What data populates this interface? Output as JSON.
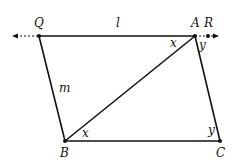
{
  "figure": {
    "type": "geometry-diagram",
    "points": {
      "Q": {
        "label": "Q"
      },
      "A": {
        "label": "A"
      },
      "R": {
        "label": "R"
      },
      "B": {
        "label": "B"
      },
      "C": {
        "label": "C"
      }
    },
    "lines": {
      "l": {
        "label": "l"
      },
      "m": {
        "label": "m"
      }
    },
    "angles": {
      "QAB": {
        "label": "x"
      },
      "ABC": {
        "label": "x"
      },
      "RAC": {
        "label": "y"
      },
      "BCA": {
        "label": "y"
      }
    }
  }
}
